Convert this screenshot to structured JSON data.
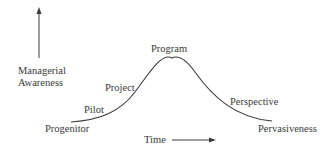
{
  "diagram": {
    "y_axis_label_line1": "Managerial",
    "y_axis_label_line2": "Awareness",
    "x_axis_label": "Time",
    "stages": [
      {
        "label": "Progenitor"
      },
      {
        "label": "Pilot"
      },
      {
        "label": "Project"
      },
      {
        "label": "Program"
      },
      {
        "label": "Perspective"
      },
      {
        "label": "Pervasiveness"
      }
    ],
    "colors": {
      "line": "#3a3a3a",
      "text": "#3a3a3a",
      "background": "#ffffff"
    }
  }
}
